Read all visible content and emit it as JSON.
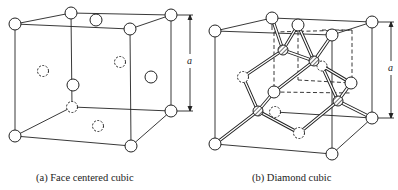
{
  "figures": [
    {
      "id": "fcc",
      "caption": "(a) Face centered cubic",
      "dimension_label": "a"
    },
    {
      "id": "diamond",
      "caption": "(b) Diamond cubic",
      "dimension_label": "a"
    }
  ],
  "colors": {
    "line": "#222222",
    "atom_fill": "#ffffff"
  }
}
